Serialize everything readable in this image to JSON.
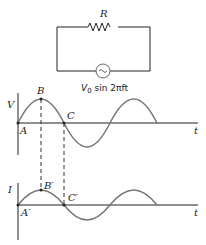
{
  "circuit": {
    "resistor_label": "R",
    "source_label_prefix": "V",
    "source_label_sub": "0",
    "source_label_suffix": " sin 2πft"
  },
  "voltage_graph": {
    "y_axis_label": "V",
    "x_axis_label": "t",
    "points": [
      "A",
      "B",
      "C"
    ]
  },
  "current_graph": {
    "y_axis_label": "I",
    "x_axis_label": "t",
    "points": [
      "A′",
      "B′",
      "C′"
    ]
  },
  "colors": {
    "line": "#222222",
    "curve": "#777777",
    "dashed": "#333333"
  }
}
